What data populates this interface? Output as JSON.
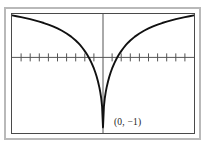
{
  "figure": {
    "name": "graphing-calculator-plot",
    "background_color": "#ffffff",
    "outer_frame_color": "#b9b9b9",
    "plot_frame_color": "#4a4a4a",
    "curve_color": "#111111",
    "axis_color": "#555555"
  },
  "annotations": {
    "minimum_point_label": "(0, −1)"
  },
  "chart_data": {
    "type": "line",
    "title": "",
    "subtitle": "",
    "xlabel": "",
    "ylabel": "",
    "xlim": [
      -10,
      10
    ],
    "ylim": [
      -1.08,
      0.62
    ],
    "grid": false,
    "legend": null,
    "axes": {
      "x_axis_shown": true,
      "y_axis_shown": true,
      "x_axis_y_value": 0,
      "y_axis_x_value": 0,
      "x_tick_step": 1,
      "x_tick_count": 19,
      "x_tick_labels_shown": false,
      "y_tick_labels_shown": false,
      "x_ticks": [
        -9,
        -8,
        -7,
        -6,
        -5,
        -4,
        -3,
        -2,
        -1,
        0,
        1,
        2,
        3,
        4,
        5,
        6,
        7,
        8,
        9
      ]
    },
    "annotations": [
      {
        "text": "(0, −1)",
        "x": 0,
        "y": -1,
        "marker": "none",
        "position": "right-of-point"
      }
    ],
    "series": [
      {
        "name": "curve",
        "x": [
          -10.0,
          -9.5,
          -9.0,
          -8.5,
          -8.0,
          -7.5,
          -7.0,
          -6.5,
          -6.0,
          -5.5,
          -5.0,
          -4.5,
          -4.0,
          -3.5,
          -3.0,
          -2.75,
          -2.5,
          -2.25,
          -2.0,
          -1.75,
          -1.5,
          -1.25,
          -1.0,
          -0.85,
          -0.7,
          -0.55,
          -0.4,
          -0.3,
          -0.2,
          -0.1,
          0.0,
          0.1,
          0.2,
          0.3,
          0.4,
          0.55,
          0.7,
          0.85,
          1.0,
          1.25,
          1.5,
          1.75,
          2.0,
          2.25,
          2.5,
          2.75,
          3.0,
          3.5,
          4.0,
          4.5,
          5.0,
          5.5,
          6.0,
          6.5,
          7.0,
          7.5,
          8.0,
          8.5,
          9.0,
          9.5,
          10.0
        ],
        "y": [
          0.6,
          0.588,
          0.575,
          0.561,
          0.546,
          0.529,
          0.511,
          0.491,
          0.468,
          0.443,
          0.414,
          0.381,
          0.342,
          0.297,
          0.242,
          0.21,
          0.174,
          0.134,
          0.09,
          0.041,
          -0.016,
          -0.081,
          -0.158,
          -0.212,
          -0.273,
          -0.344,
          -0.428,
          -0.496,
          -0.58,
          -0.704,
          -1.0,
          -0.704,
          -0.58,
          -0.496,
          -0.428,
          -0.344,
          -0.273,
          -0.212,
          -0.158,
          -0.081,
          -0.016,
          0.041,
          0.09,
          0.134,
          0.174,
          0.21,
          0.242,
          0.297,
          0.342,
          0.381,
          0.414,
          0.443,
          0.468,
          0.491,
          0.511,
          0.529,
          0.546,
          0.561,
          0.575,
          0.588,
          0.6
        ]
      }
    ]
  }
}
